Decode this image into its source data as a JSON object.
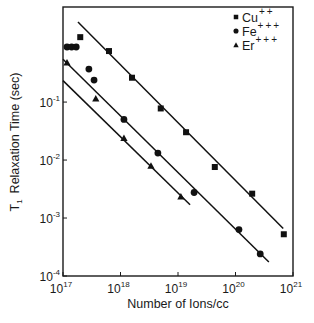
{
  "chart_data": {
    "type": "scatter",
    "title": "",
    "xlabel": "Number of Ions/cc",
    "ylabel_main": "T",
    "ylabel_sub": "1",
    "ylabel_rest": "Relaxation Time (sec)",
    "xscale": "log",
    "yscale": "log",
    "xlim_log10": [
      17,
      21
    ],
    "ylim_log10": [
      -4,
      0.64
    ],
    "grid": false,
    "legend_position": "top-right",
    "x_ticks": [
      {
        "base": "10",
        "exp": "17",
        "log10": 17
      },
      {
        "base": "10",
        "exp": "18",
        "log10": 18
      },
      {
        "base": "10",
        "exp": "19",
        "log10": 19
      },
      {
        "base": "10",
        "exp": "20",
        "log10": 20
      },
      {
        "base": "10",
        "exp": "21",
        "log10": 21
      }
    ],
    "y_ticks": [
      {
        "base": "10",
        "exp": "-4",
        "log10": -4
      },
      {
        "base": "10",
        "exp": "-3",
        "log10": -3
      },
      {
        "base": "10",
        "exp": "-2",
        "log10": -2
      },
      {
        "base": "10",
        "exp": "-1",
        "log10": -1
      }
    ],
    "series": [
      {
        "name": "Cu++",
        "label_base": "Cu",
        "label_sup": "++",
        "marker": "square",
        "color": "#111111",
        "points_log10": [
          [
            17.3,
            0.12
          ],
          [
            17.8,
            -0.12
          ],
          [
            18.2,
            -0.58
          ],
          [
            18.7,
            -1.11
          ],
          [
            19.14,
            -1.52
          ],
          [
            19.64,
            -2.12
          ],
          [
            20.29,
            -2.58
          ],
          [
            20.84,
            -3.28
          ]
        ],
        "fit_line_log10": [
          [
            17.26,
            0.38
          ],
          [
            20.83,
            -3.18
          ]
        ]
      },
      {
        "name": "Fe+++",
        "label_base": "Fe",
        "label_sup": "+++",
        "marker": "circle",
        "color": "#111111",
        "points_log10": [
          [
            17.07,
            -0.05
          ],
          [
            17.15,
            -0.05
          ],
          [
            17.23,
            -0.05
          ],
          [
            17.45,
            -0.43
          ],
          [
            17.54,
            -0.62
          ],
          [
            18.06,
            -1.3
          ],
          [
            18.65,
            -1.88
          ],
          [
            19.28,
            -2.56
          ],
          [
            20.06,
            -3.2
          ],
          [
            20.43,
            -3.62
          ]
        ],
        "fit_line_log10": [
          [
            17.0,
            -0.26
          ],
          [
            20.58,
            -3.76
          ]
        ]
      },
      {
        "name": "Er+++",
        "label_base": "Er",
        "label_sup": "+++",
        "marker": "triangle",
        "color": "#111111",
        "points_log10": [
          [
            17.07,
            -0.32
          ],
          [
            17.57,
            -0.94
          ],
          [
            18.06,
            -1.62
          ],
          [
            18.53,
            -2.1
          ],
          [
            19.05,
            -2.63
          ]
        ],
        "fit_line_log10": [
          [
            17.0,
            -0.63
          ],
          [
            19.21,
            -2.77
          ]
        ]
      }
    ]
  }
}
